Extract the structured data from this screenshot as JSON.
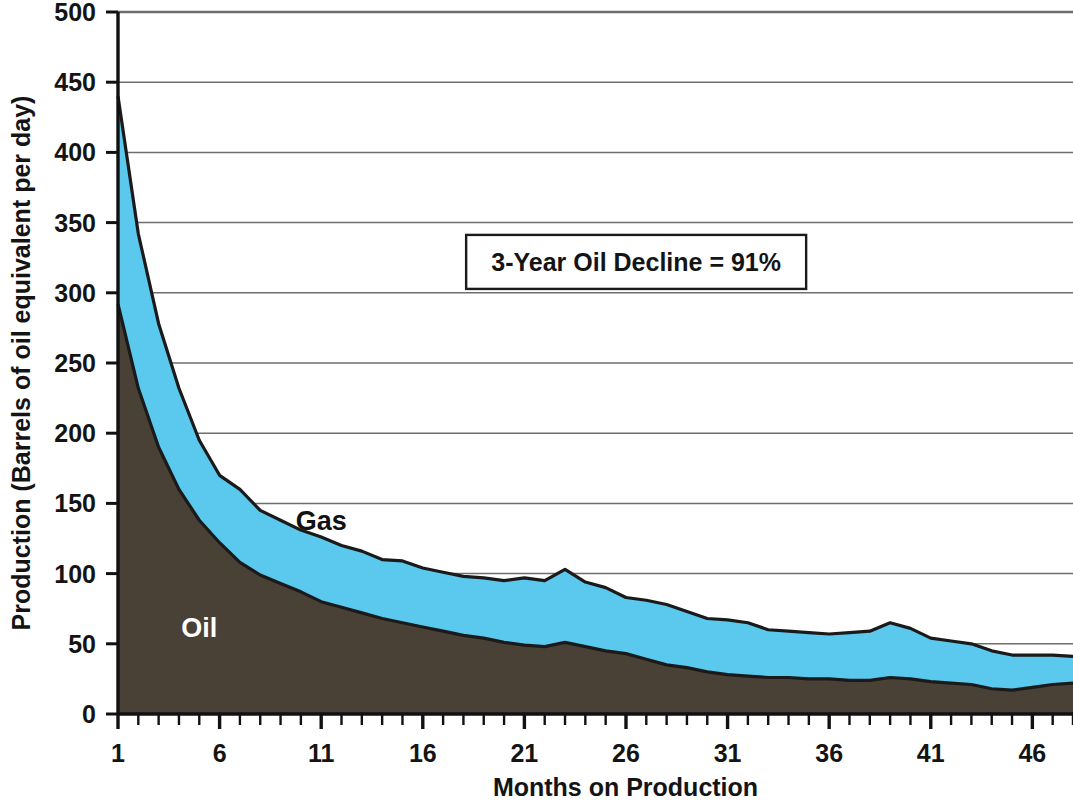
{
  "chart_data": {
    "type": "area",
    "stacked": true,
    "title": "",
    "xlabel": "Months on Production",
    "ylabel": "Production (Barrels of oil equivalent per day)",
    "xlim": [
      1,
      48
    ],
    "ylim": [
      0,
      500
    ],
    "ytick_interval": 50,
    "yticks": [
      0,
      50,
      100,
      150,
      200,
      250,
      300,
      350,
      400,
      450,
      500
    ],
    "ytick_labels": [
      "0",
      "50",
      "100",
      "150",
      "200",
      "250",
      "300",
      "350",
      "400",
      "450",
      "500"
    ],
    "xticks": [
      1,
      6,
      11,
      16,
      21,
      26,
      31,
      36,
      41,
      46
    ],
    "xtick_labels": [
      "1",
      "6",
      "11",
      "16",
      "21",
      "26",
      "31",
      "36",
      "41",
      "46"
    ],
    "x_minor_tick_interval": 1,
    "grid": "horizontal",
    "legend_position": "inline-annotations",
    "colors": {
      "oil": "#4a4136",
      "gas": "#5bc8ee",
      "outline": "#1a1a1a",
      "gridline": "#6e6e6e",
      "axis": "#111111",
      "background": "#ffffff",
      "oil_label_text": "#ffffff",
      "gas_label_text": "#111111"
    },
    "annotations": [
      {
        "name": "decline-callout",
        "text": "3-Year Oil Decline = 91%",
        "x_month": 26.5,
        "y_value": 322
      }
    ],
    "series": [
      {
        "name": "Oil",
        "label": "Oil",
        "label_x_month": 5.0,
        "label_y_value": 55,
        "color": "#4a4136",
        "x": [
          1,
          2,
          3,
          4,
          5,
          6,
          7,
          8,
          9,
          10,
          11,
          12,
          13,
          14,
          15,
          16,
          17,
          18,
          19,
          20,
          21,
          22,
          23,
          24,
          25,
          26,
          27,
          28,
          29,
          30,
          31,
          32,
          33,
          34,
          35,
          36,
          37,
          38,
          39,
          40,
          41,
          42,
          43,
          44,
          45,
          46,
          47,
          48
        ],
        "values": [
          292,
          232,
          190,
          160,
          138,
          122,
          108,
          99,
          93,
          87,
          80,
          76,
          72,
          68,
          65,
          62,
          59,
          56,
          54,
          51,
          49,
          48,
          51,
          48,
          45,
          43,
          39,
          35,
          33,
          30,
          28,
          27,
          26,
          26,
          25,
          25,
          24,
          24,
          26,
          25,
          23,
          22,
          21,
          18,
          17,
          19,
          21,
          22
        ]
      },
      {
        "name": "Gas",
        "label": "Gas",
        "label_x_month": 11.0,
        "label_y_value": 131,
        "color": "#5bc8ee",
        "x": [
          1,
          2,
          3,
          4,
          5,
          6,
          7,
          8,
          9,
          10,
          11,
          12,
          13,
          14,
          15,
          16,
          17,
          18,
          19,
          20,
          21,
          22,
          23,
          24,
          25,
          26,
          27,
          28,
          29,
          30,
          31,
          32,
          33,
          34,
          35,
          36,
          37,
          38,
          39,
          40,
          41,
          42,
          43,
          44,
          45,
          46,
          47,
          48
        ],
        "values": [
          148,
          110,
          88,
          72,
          57,
          48,
          52,
          46,
          45,
          44,
          46,
          44,
          44,
          42,
          44,
          42,
          42,
          42,
          43,
          44,
          48,
          47,
          52,
          46,
          45,
          40,
          42,
          43,
          40,
          38,
          39,
          38,
          34,
          33,
          33,
          32,
          34,
          35,
          39,
          36,
          31,
          30,
          29,
          27,
          25,
          23,
          21,
          19
        ]
      }
    ],
    "total": {
      "name": "Total (Oil + Gas)",
      "values": [
        440,
        342,
        278,
        232,
        195,
        170,
        160,
        145,
        138,
        131,
        126,
        120,
        116,
        110,
        109,
        104,
        101,
        98,
        97,
        95,
        97,
        95,
        103,
        94,
        90,
        83,
        81,
        78,
        73,
        68,
        67,
        65,
        60,
        59,
        58,
        57,
        58,
        59,
        65,
        61,
        54,
        52,
        50,
        45,
        42,
        42,
        42,
        41
      ]
    }
  }
}
